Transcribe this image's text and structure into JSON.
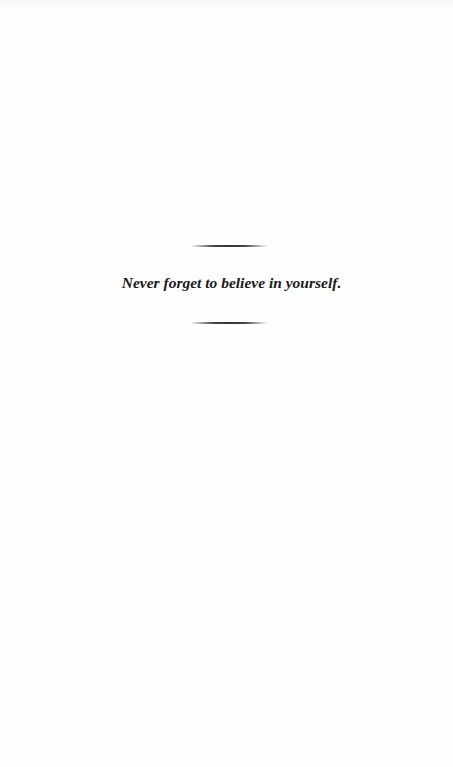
{
  "page": {
    "quote": "Never forget to believe in yourself.",
    "colors": {
      "background": "#fefefe",
      "text": "#1a1a1a",
      "rule": "#333333"
    }
  }
}
